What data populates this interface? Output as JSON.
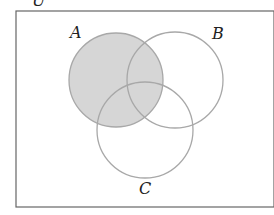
{
  "diagram": {
    "type": "venn",
    "universal_label": "U",
    "sets": [
      {
        "id": "A",
        "label": "A",
        "shaded": true
      },
      {
        "id": "B",
        "label": "B",
        "shaded": false
      },
      {
        "id": "C",
        "label": "C",
        "shaded": false
      }
    ],
    "shaded_region": "A",
    "colors": {
      "shade": "#d6d6d6",
      "stroke": "#a8a8a8",
      "border": "#666666",
      "background": "#ffffff"
    }
  }
}
